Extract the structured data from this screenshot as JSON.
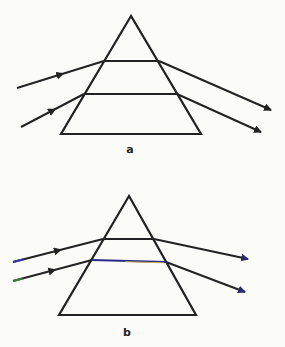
{
  "diagrams": [
    {
      "label": "a",
      "description": "Prism with two parallel rays refracted; uniform bending (no dispersion)",
      "label_pos": [
        130,
        144
      ],
      "prism": {
        "apex": [
          131,
          16
        ],
        "base_left": [
          61,
          134
        ],
        "base_right": [
          201,
          134
        ]
      },
      "rays": [
        {
          "in_start": [
            17,
            88
          ],
          "entry": [
            104,
            61
          ],
          "exit": [
            159,
            61
          ],
          "out_end": [
            271,
            110
          ],
          "in_color": "#222222",
          "inner_color": "#222222",
          "out_color": "#222222"
        },
        {
          "in_start": [
            21,
            127
          ],
          "entry": [
            84,
            94
          ],
          "exit": [
            177,
            94
          ],
          "out_end": [
            261,
            132
          ],
          "in_color": "#222222",
          "inner_color": "#222222",
          "out_color": "#222222"
        }
      ]
    },
    {
      "label": "b",
      "description": "Prism with two parallel rays; faint color tints indicate dispersion",
      "label_pos": [
        127,
        327
      ],
      "prism": {
        "apex": [
          129,
          196
        ],
        "base_left": [
          59,
          315
        ],
        "base_right": [
          196,
          315
        ]
      },
      "rays": [
        {
          "in_start": [
            13,
            262
          ],
          "entry": [
            103,
            239
          ],
          "exit": [
            154,
            239
          ],
          "out_end": [
            248,
            259
          ],
          "in_color": "#2a2a60",
          "inner_color": "#222222",
          "out_color": "#222222"
        },
        {
          "in_start": [
            13,
            281
          ],
          "entry": [
            92,
            260
          ],
          "exit": [
            166,
            262
          ],
          "out_end": [
            245,
            292
          ],
          "in_color": "#2e4a2e",
          "inner_color": "#2a2a8a",
          "out_color": "#222222"
        }
      ]
    }
  ],
  "colors": {
    "line": "#222222",
    "arrow_b": "#2a2a70",
    "tint_yellow": "#c8b24a"
  }
}
